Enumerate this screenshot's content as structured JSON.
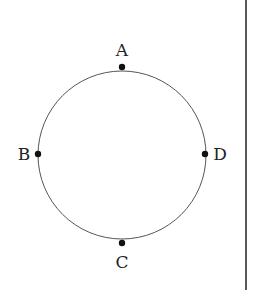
{
  "diagram": {
    "type": "circle-with-points",
    "circle": {
      "cx": 122,
      "cy": 155,
      "r": 84,
      "stroke": "#555555"
    },
    "points": [
      {
        "label": "A",
        "x": 122,
        "y": 67,
        "label_x": 122,
        "label_y": 56
      },
      {
        "label": "B",
        "x": 38,
        "y": 154,
        "label_x": 24,
        "label_y": 160
      },
      {
        "label": "C",
        "x": 122,
        "y": 243,
        "label_x": 122,
        "label_y": 268
      },
      {
        "label": "D",
        "x": 205,
        "y": 154,
        "label_x": 220,
        "label_y": 160
      }
    ],
    "divider": {
      "x": 246,
      "y1": 0,
      "y2": 290,
      "stroke": "#222222"
    }
  }
}
